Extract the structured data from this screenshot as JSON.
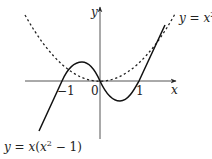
{
  "figure": {
    "axes": {
      "x_label": "x",
      "y_label": "y",
      "tick_labels": {
        "neg_one": "−1",
        "zero": "0",
        "one": "1"
      }
    },
    "curves": {
      "parabola": {
        "label_lhs": "y",
        "label_eq": " = ",
        "label_var": "x",
        "label_exp": "2",
        "style": "dashed"
      },
      "cubic": {
        "label_lhs": "y",
        "label_eq": " = ",
        "label_var": "x",
        "label_open": "(",
        "label_var2": "x",
        "label_exp": "2",
        "label_rest": " − 1)",
        "style": "solid"
      }
    },
    "colors": {
      "ink": "#222222",
      "background": "#ffffff"
    }
  }
}
